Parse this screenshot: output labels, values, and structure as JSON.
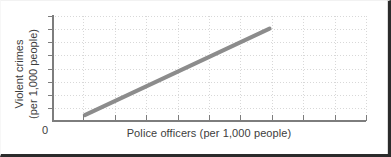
{
  "figure": {
    "background_color": "#ffffff",
    "frame_color": "#2b2b2b",
    "origin_label": "0"
  },
  "chart_data": {
    "type": "line",
    "title": "",
    "subtitle": "",
    "xlabel": "Police officers (per 1,000 people)",
    "ylabel_line1": "Violent crimes",
    "ylabel_line2": "(per 1,000 people)",
    "ylabel": "Violent crimes (per 1,000 people)",
    "series": [
      {
        "name": "Violent crimes vs. police officers",
        "color": "#8c8c8c",
        "line_width_px": 4,
        "x": [
          0.5,
          3.5
        ],
        "y": [
          0.25,
          4.45
        ],
        "points": [
          {
            "x": 0.5,
            "y": 0.25
          },
          {
            "x": 3.5,
            "y": 4.45
          }
        ]
      }
    ],
    "xlim": [
      0,
      5
    ],
    "ylim": [
      0,
      5
    ],
    "x_tick_values": [
      0,
      0.5,
      1,
      1.5,
      2,
      2.5,
      3,
      3.5,
      4,
      4.5,
      5
    ],
    "y_tick_values": [
      0,
      0.625,
      1.25,
      1.875,
      2.5,
      3.125,
      3.75,
      4.375,
      5
    ],
    "x_tick_labels": [
      "",
      "",
      "",
      "",
      "",
      "",
      "",
      "",
      "",
      "",
      ""
    ],
    "y_tick_labels": [
      "",
      "",
      "",
      "",
      "",
      "",
      "",
      "",
      ""
    ],
    "grid": true,
    "grid_style": "dotted",
    "grid_color": "#d8d8d8",
    "legend": false,
    "legend_position": "none",
    "axis_color": "#7d7d7d",
    "annotations": []
  }
}
